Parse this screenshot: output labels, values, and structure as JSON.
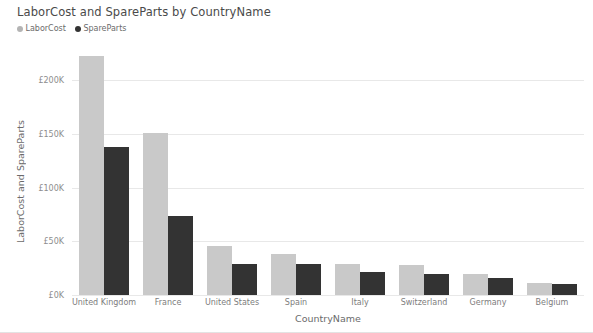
{
  "chart_data": {
    "type": "bar",
    "title": "LaborCost and SpareParts by CountryName",
    "xlabel": "CountryName",
    "ylabel": "LaborCost and SpareParts",
    "categories": [
      "United Kingdom",
      "France",
      "United States",
      "Spain",
      "Italy",
      "Switzerland",
      "Germany",
      "Belgium"
    ],
    "series": [
      {
        "name": "LaborCost",
        "color": "#c9c9c9",
        "values": [
          223000,
          151000,
          46000,
          38000,
          29000,
          28000,
          20000,
          11000
        ]
      },
      {
        "name": "SpareParts",
        "color": "#333333",
        "values": [
          138000,
          74000,
          29000,
          29000,
          21000,
          20000,
          16000,
          10000
        ]
      }
    ],
    "ylim": [
      0,
      232000
    ],
    "yticks": [
      0,
      50000,
      100000,
      150000,
      200000
    ],
    "ytick_labels": [
      "£0K",
      "£50K",
      "£100K",
      "£150K",
      "£200K"
    ],
    "grid": true,
    "legend_position": "top-left",
    "currency_symbol": "£"
  },
  "legend": {
    "items": [
      {
        "label": "LaborCost",
        "marker": "circle-marker",
        "color": "#b4b4b4"
      },
      {
        "label": "SpareParts",
        "marker": "circle-marker",
        "color": "#333333"
      }
    ]
  }
}
